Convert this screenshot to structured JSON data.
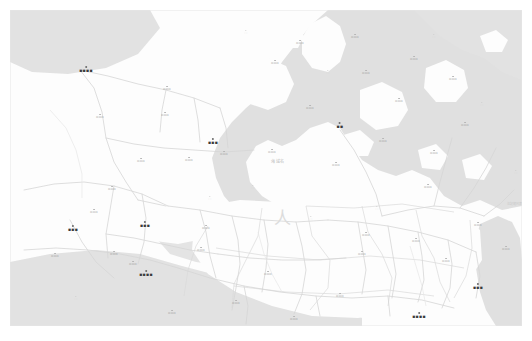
{
  "app": {
    "view": "map-viewer",
    "background_color": "#ffffff"
  },
  "map": {
    "name": "regional-reference-map",
    "land_color": "#fdfdfd",
    "water_color": "#e0e0e0",
    "base_color": "#f2f2f2",
    "road_color": "#d8d8d8",
    "boundary_color": "#dcdcdc",
    "frame": {
      "x": 10,
      "y": 10,
      "width": 512,
      "height": 316
    },
    "sea_glyph": "人",
    "sea_label": "海域名",
    "corner_note": "注記\n縮尺表示",
    "labels": [
      {
        "id": "city-nw",
        "text": "▪▪▪▪",
        "tier": "major",
        "x": 76,
        "y": 56
      },
      {
        "id": "city-n-mid",
        "text": "▪▪▪",
        "tier": "major",
        "x": 203,
        "y": 128
      },
      {
        "id": "city-ne",
        "text": "▪▪",
        "tier": "major",
        "x": 330,
        "y": 112
      },
      {
        "id": "city-w",
        "text": "▪▪▪",
        "tier": "major",
        "x": 63,
        "y": 215
      },
      {
        "id": "city-c-left",
        "text": "▪▪▪",
        "tier": "major",
        "x": 135,
        "y": 211
      },
      {
        "id": "city-sw",
        "text": "▪▪▪▪",
        "tier": "major",
        "x": 136,
        "y": 260
      },
      {
        "id": "city-se",
        "text": "▪▪▪",
        "tier": "major",
        "x": 468,
        "y": 273
      },
      {
        "id": "city-s-mid",
        "text": "▪▪▪▪",
        "tier": "major",
        "x": 409,
        "y": 302
      },
      {
        "id": "town-n-01",
        "text": "▫▫▫",
        "tier": "mid",
        "x": 345,
        "y": 24
      },
      {
        "id": "town-n-02",
        "text": "▫▫▫",
        "tier": "mid",
        "x": 356,
        "y": 60
      },
      {
        "id": "town-n-03",
        "text": "▫▫▫",
        "tier": "mid",
        "x": 290,
        "y": 30
      },
      {
        "id": "town-n-04",
        "text": "▫▫▫",
        "tier": "mid",
        "x": 404,
        "y": 46
      },
      {
        "id": "town-n-05",
        "text": "▫▫▫",
        "tier": "mid",
        "x": 443,
        "y": 66
      },
      {
        "id": "town-n-06",
        "text": "▫▫▫",
        "tier": "mid",
        "x": 389,
        "y": 88
      },
      {
        "id": "town-n-07",
        "text": "▫▫▫",
        "tier": "mid",
        "x": 300,
        "y": 95
      },
      {
        "id": "town-n-08",
        "text": "▫▫▫",
        "tier": "mid",
        "x": 265,
        "y": 50
      },
      {
        "id": "town-n-09",
        "text": "▫▫▫",
        "tier": "mid",
        "x": 157,
        "y": 76
      },
      {
        "id": "town-n-10",
        "text": "▫▫▫",
        "tier": "mid",
        "x": 90,
        "y": 104
      },
      {
        "id": "town-c-01",
        "text": "▫▫▫",
        "tier": "mid",
        "x": 155,
        "y": 102
      },
      {
        "id": "town-c-02",
        "text": "▫▫▫",
        "tier": "mid",
        "x": 131,
        "y": 148
      },
      {
        "id": "town-c-03",
        "text": "▫▫▫",
        "tier": "mid",
        "x": 179,
        "y": 147
      },
      {
        "id": "town-c-04",
        "text": "▫▫▫",
        "tier": "mid",
        "x": 214,
        "y": 141
      },
      {
        "id": "town-c-05",
        "text": "▫▫▫",
        "tier": "mid",
        "x": 262,
        "y": 139
      },
      {
        "id": "town-c-06",
        "text": "▫▫▫",
        "tier": "mid",
        "x": 373,
        "y": 128
      },
      {
        "id": "town-c-07",
        "text": "▫▫▫",
        "tier": "mid",
        "x": 424,
        "y": 140
      },
      {
        "id": "town-c-08",
        "text": "▫▫▫",
        "tier": "mid",
        "x": 455,
        "y": 112
      },
      {
        "id": "town-c-09",
        "text": "▫▫▫",
        "tier": "mid",
        "x": 326,
        "y": 152
      },
      {
        "id": "town-c-10",
        "text": "▫▫▫",
        "tier": "mid",
        "x": 418,
        "y": 174
      },
      {
        "id": "town-s-01",
        "text": "▫▫▫",
        "tier": "mid",
        "x": 102,
        "y": 176
      },
      {
        "id": "town-s-02",
        "text": "▫▫▫",
        "tier": "mid",
        "x": 84,
        "y": 199
      },
      {
        "id": "town-s-03",
        "text": "▫▫▫",
        "tier": "mid",
        "x": 45,
        "y": 243
      },
      {
        "id": "town-s-04",
        "text": "▫▫▫",
        "tier": "mid",
        "x": 104,
        "y": 241
      },
      {
        "id": "town-s-05",
        "text": "▫▫▫",
        "tier": "mid",
        "x": 123,
        "y": 251
      },
      {
        "id": "town-s-06",
        "text": "▫▫▫",
        "tier": "mid",
        "x": 191,
        "y": 237
      },
      {
        "id": "town-s-07",
        "text": "▫▫▫",
        "tier": "mid",
        "x": 196,
        "y": 215
      },
      {
        "id": "town-s-08",
        "text": "▫▫▫",
        "tier": "mid",
        "x": 258,
        "y": 261
      },
      {
        "id": "town-s-09",
        "text": "▫▫▫",
        "tier": "mid",
        "x": 284,
        "y": 306
      },
      {
        "id": "town-s-10",
        "text": "▫▫▫",
        "tier": "mid",
        "x": 352,
        "y": 241
      },
      {
        "id": "town-s-11",
        "text": "▫▫▫",
        "tier": "mid",
        "x": 356,
        "y": 222
      },
      {
        "id": "town-s-12",
        "text": "▫▫▫",
        "tier": "mid",
        "x": 406,
        "y": 228
      },
      {
        "id": "town-s-13",
        "text": "▫▫▫",
        "tier": "mid",
        "x": 436,
        "y": 248
      },
      {
        "id": "town-s-14",
        "text": "▫▫▫",
        "tier": "mid",
        "x": 468,
        "y": 212
      },
      {
        "id": "town-s-15",
        "text": "▫▫▫",
        "tier": "mid",
        "x": 496,
        "y": 236
      },
      {
        "id": "town-s-16",
        "text": "▫▫▫",
        "tier": "mid",
        "x": 330,
        "y": 283
      },
      {
        "id": "town-s-17",
        "text": "▫▫▫",
        "tier": "mid",
        "x": 226,
        "y": 290
      },
      {
        "id": "town-s-18",
        "text": "▫▫▫",
        "tier": "mid",
        "x": 162,
        "y": 300
      },
      {
        "id": "minor-01",
        "text": "···",
        "tier": "minor",
        "x": 236,
        "y": 20
      },
      {
        "id": "minor-02",
        "text": "···",
        "tier": "minor",
        "x": 318,
        "y": 60
      },
      {
        "id": "minor-03",
        "text": "···",
        "tier": "minor",
        "x": 424,
        "y": 24
      },
      {
        "id": "minor-04",
        "text": "···",
        "tier": "minor",
        "x": 472,
        "y": 92
      },
      {
        "id": "minor-05",
        "text": "···",
        "tier": "minor",
        "x": 243,
        "y": 175
      },
      {
        "id": "minor-06",
        "text": "···",
        "tier": "minor",
        "x": 200,
        "y": 186
      },
      {
        "id": "minor-07",
        "text": "···",
        "tier": "minor",
        "x": 367,
        "y": 196
      },
      {
        "id": "minor-08",
        "text": "···",
        "tier": "minor",
        "x": 301,
        "y": 206
      },
      {
        "id": "minor-09",
        "text": "···",
        "tier": "minor",
        "x": 66,
        "y": 286
      },
      {
        "id": "minor-10",
        "text": "···",
        "tier": "minor",
        "x": 506,
        "y": 160
      }
    ]
  }
}
